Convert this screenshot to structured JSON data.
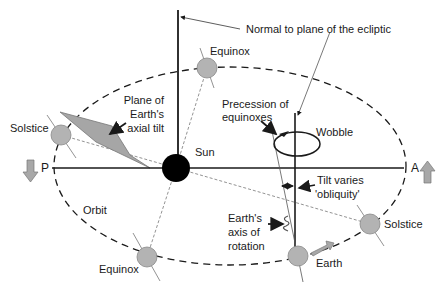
{
  "diagram": {
    "labels": {
      "normal": "Normal to plane of the ecliptic",
      "equinox_top": "Equinox",
      "plane_tilt_1": "Plane of",
      "plane_tilt_2": "Earth's",
      "plane_tilt_3": "axial tilt",
      "solstice_left": "Solstice",
      "sun": "Sun",
      "precession_1": "Precession of",
      "precession_2": "equinoxes",
      "wobble": "Wobble",
      "perihelion": "P",
      "aphelion": "A",
      "tilt_1": "Tilt varies",
      "tilt_2": "'obliquity'",
      "orbit": "Orbit",
      "axis_1": "Earth's",
      "axis_2": "axis of",
      "axis_3": "rotation",
      "solstice_right": "Solstice",
      "equinox_bottom": "Equinox",
      "earth": "Earth"
    },
    "colors": {
      "planet_fill": "#b3b3b3",
      "sun_fill": "#000000",
      "line": "#1a1a1a",
      "arrow_fill": "#a8a8a8"
    }
  }
}
